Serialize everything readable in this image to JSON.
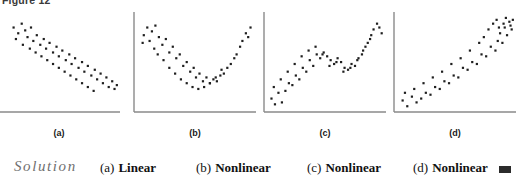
{
  "figure": {
    "caption": "Figure 12"
  },
  "panels": [
    {
      "id": "a",
      "label": "(a)",
      "relationship": "Linear",
      "shape": "decreasing-linear",
      "x": -6,
      "y_axis_visible": false
    },
    {
      "id": "b",
      "label": "(b)",
      "relationship": "Nonlinear",
      "shape": "u-shaped-quadratic",
      "x": 130,
      "y_axis_visible": true
    },
    {
      "id": "c",
      "label": "(c)",
      "relationship": "Nonlinear",
      "shape": "wavy-increasing",
      "x": 260,
      "y_axis_visible": true
    },
    {
      "id": "d",
      "label": "(d)",
      "relationship": "Nonlinear",
      "shape": "exponential-increasing",
      "x": 390,
      "y_axis_visible": true
    }
  ],
  "solution": {
    "word": "Solution",
    "answers": [
      {
        "tag": "(a)",
        "text": "Linear",
        "x": 100
      },
      {
        "tag": "(b)",
        "text": "Nonlinear",
        "x": 196
      },
      {
        "tag": "(c)",
        "text": "Nonlinear",
        "x": 307
      },
      {
        "tag": "(d)",
        "text": "Nonlinear",
        "x": 413
      }
    ],
    "end_marker": "filled-square"
  },
  "style": {
    "axis_color": "#8a8a8a",
    "dot_color": "#1f1f1f",
    "background": "#ffffff"
  },
  "chart_data": {
    "type": "scatter",
    "title": "Figure 12",
    "panel_count": 4,
    "xlabel": "",
    "ylabel": "",
    "grid": false,
    "legend": "none",
    "axis_ranges": {
      "x": [
        0,
        100
      ],
      "y": [
        0,
        100
      ]
    },
    "panels": [
      {
        "id": "a",
        "label": "(a)",
        "relationship": "Linear",
        "trend": "negative",
        "points": [
          [
            10,
            88
          ],
          [
            14,
            82
          ],
          [
            17,
            92
          ],
          [
            20,
            85
          ],
          [
            12,
            76
          ],
          [
            22,
            78
          ],
          [
            25,
            88
          ],
          [
            18,
            70
          ],
          [
            27,
            74
          ],
          [
            30,
            80
          ],
          [
            24,
            66
          ],
          [
            33,
            70
          ],
          [
            36,
            76
          ],
          [
            29,
            62
          ],
          [
            38,
            66
          ],
          [
            41,
            72
          ],
          [
            34,
            58
          ],
          [
            44,
            62
          ],
          [
            47,
            68
          ],
          [
            39,
            54
          ],
          [
            49,
            58
          ],
          [
            52,
            64
          ],
          [
            44,
            50
          ],
          [
            55,
            54
          ],
          [
            58,
            60
          ],
          [
            49,
            46
          ],
          [
            60,
            50
          ],
          [
            63,
            56
          ],
          [
            54,
            42
          ],
          [
            66,
            46
          ],
          [
            69,
            52
          ],
          [
            59,
            38
          ],
          [
            71,
            42
          ],
          [
            74,
            48
          ],
          [
            64,
            34
          ],
          [
            77,
            38
          ],
          [
            80,
            44
          ],
          [
            69,
            30
          ],
          [
            82,
            34
          ],
          [
            85,
            40
          ],
          [
            74,
            26
          ],
          [
            87,
            30
          ],
          [
            90,
            36
          ],
          [
            79,
            22
          ],
          [
            92,
            26
          ],
          [
            95,
            32
          ],
          [
            97,
            24
          ],
          [
            99,
            28
          ]
        ]
      },
      {
        "id": "b",
        "label": "(b)",
        "relationship": "Nonlinear",
        "trend": "u-shaped",
        "points": [
          [
            5,
            80
          ],
          [
            8,
            88
          ],
          [
            12,
            84
          ],
          [
            4,
            72
          ],
          [
            15,
            90
          ],
          [
            10,
            74
          ],
          [
            18,
            78
          ],
          [
            14,
            66
          ],
          [
            21,
            70
          ],
          [
            24,
            76
          ],
          [
            17,
            60
          ],
          [
            27,
            62
          ],
          [
            30,
            68
          ],
          [
            22,
            54
          ],
          [
            33,
            56
          ],
          [
            36,
            60
          ],
          [
            27,
            46
          ],
          [
            39,
            48
          ],
          [
            42,
            52
          ],
          [
            32,
            40
          ],
          [
            45,
            42
          ],
          [
            48,
            46
          ],
          [
            37,
            34
          ],
          [
            50,
            36
          ],
          [
            53,
            40
          ],
          [
            42,
            30
          ],
          [
            56,
            32
          ],
          [
            59,
            36
          ],
          [
            47,
            26
          ],
          [
            62,
            30
          ],
          [
            65,
            34
          ],
          [
            52,
            24
          ],
          [
            68,
            32
          ],
          [
            71,
            38
          ],
          [
            57,
            26
          ],
          [
            74,
            40
          ],
          [
            77,
            46
          ],
          [
            62,
            30
          ],
          [
            80,
            50
          ],
          [
            83,
            56
          ],
          [
            67,
            36
          ],
          [
            85,
            60
          ],
          [
            88,
            68
          ],
          [
            72,
            44
          ],
          [
            90,
            74
          ],
          [
            93,
            82
          ],
          [
            95,
            78
          ],
          [
            97,
            88
          ]
        ]
      },
      {
        "id": "c",
        "label": "(c)",
        "relationship": "Nonlinear",
        "trend": "wavy-increasing",
        "points": [
          [
            3,
            14
          ],
          [
            6,
            8
          ],
          [
            9,
            20
          ],
          [
            12,
            10
          ],
          [
            5,
            26
          ],
          [
            15,
            22
          ],
          [
            18,
            30
          ],
          [
            11,
            34
          ],
          [
            21,
            28
          ],
          [
            24,
            38
          ],
          [
            17,
            42
          ],
          [
            27,
            34
          ],
          [
            30,
            46
          ],
          [
            23,
            50
          ],
          [
            33,
            42
          ],
          [
            36,
            54
          ],
          [
            29,
            58
          ],
          [
            39,
            48
          ],
          [
            42,
            60
          ],
          [
            35,
            64
          ],
          [
            45,
            56
          ],
          [
            48,
            62
          ],
          [
            41,
            68
          ],
          [
            51,
            58
          ],
          [
            54,
            54
          ],
          [
            47,
            60
          ],
          [
            57,
            50
          ],
          [
            60,
            56
          ],
          [
            53,
            48
          ],
          [
            63,
            52
          ],
          [
            66,
            46
          ],
          [
            59,
            52
          ],
          [
            69,
            44
          ],
          [
            72,
            50
          ],
          [
            65,
            42
          ],
          [
            75,
            48
          ],
          [
            78,
            56
          ],
          [
            71,
            46
          ],
          [
            81,
            60
          ],
          [
            84,
            68
          ],
          [
            77,
            54
          ],
          [
            86,
            72
          ],
          [
            89,
            80
          ],
          [
            82,
            64
          ],
          [
            91,
            86
          ],
          [
            94,
            92
          ],
          [
            88,
            76
          ],
          [
            96,
            88
          ],
          [
            98,
            82
          ]
        ]
      },
      {
        "id": "d",
        "label": "(d)",
        "relationship": "Nonlinear",
        "trend": "exponential-increasing",
        "points": [
          [
            4,
            12
          ],
          [
            8,
            6
          ],
          [
            12,
            16
          ],
          [
            16,
            10
          ],
          [
            6,
            20
          ],
          [
            20,
            14
          ],
          [
            24,
            20
          ],
          [
            14,
            24
          ],
          [
            28,
            18
          ],
          [
            32,
            26
          ],
          [
            22,
            30
          ],
          [
            36,
            24
          ],
          [
            40,
            32
          ],
          [
            30,
            36
          ],
          [
            44,
            30
          ],
          [
            48,
            38
          ],
          [
            38,
            42
          ],
          [
            52,
            36
          ],
          [
            56,
            46
          ],
          [
            46,
            50
          ],
          [
            60,
            44
          ],
          [
            64,
            52
          ],
          [
            54,
            56
          ],
          [
            68,
            50
          ],
          [
            72,
            60
          ],
          [
            62,
            64
          ],
          [
            76,
            58
          ],
          [
            80,
            68
          ],
          [
            70,
            72
          ],
          [
            84,
            64
          ],
          [
            86,
            74
          ],
          [
            74,
            78
          ],
          [
            88,
            82
          ],
          [
            90,
            72
          ],
          [
            78,
            86
          ],
          [
            92,
            88
          ],
          [
            94,
            80
          ],
          [
            82,
            92
          ],
          [
            96,
            94
          ],
          [
            98,
            86
          ],
          [
            85,
            96
          ],
          [
            93,
            98
          ],
          [
            97,
            90
          ],
          [
            99,
            96
          ],
          [
            91,
            92
          ],
          [
            87,
            88
          ]
        ]
      }
    ]
  }
}
